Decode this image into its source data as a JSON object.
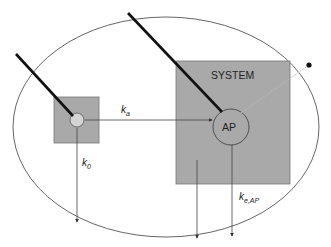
{
  "diagram": {
    "system_label": "SYSTEM",
    "ap_label": "AP",
    "rate_ka": {
      "k": "k",
      "sub": "a"
    },
    "rate_k0": {
      "k": "k",
      "sub": "0"
    },
    "rate_keap": {
      "k": "k",
      "sub": "e,AP"
    },
    "colors": {
      "box_fill": "#a9a9a9",
      "circle_fill": "#d0d0d0",
      "stroke": "#444444",
      "needle": "#111111",
      "dotted_line": "#bbbbbb"
    }
  }
}
